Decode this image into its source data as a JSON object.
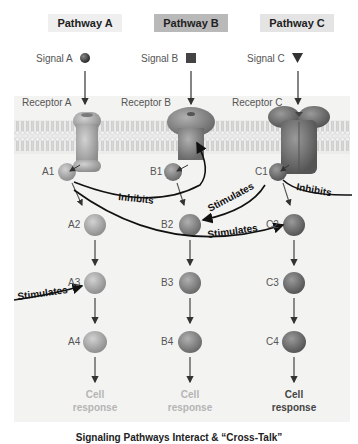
{
  "pathways": [
    {
      "header": "Pathway A",
      "signal": "Signal A",
      "signal_icon": "sphere-icon",
      "receptor": "Receptor A",
      "steps": [
        "A1",
        "A2",
        "A3",
        "A4"
      ],
      "response": "Cell\nresponse",
      "response_line1": "Cell",
      "response_line2": "response",
      "response_color": "#b5b5b5"
    },
    {
      "header": "Pathway B",
      "signal": "Signal B",
      "signal_icon": "square-icon",
      "receptor": "Receptor B",
      "steps": [
        "B1",
        "B2",
        "B3",
        "B4"
      ],
      "response_line1": "Cell",
      "response_line2": "response",
      "response_color": "#b5b5b5"
    },
    {
      "header": "Pathway C",
      "signal": "Signal C",
      "signal_icon": "triangle-down-icon",
      "receptor": "Receptor C",
      "steps": [
        "C1",
        "C2",
        "C3",
        "C4"
      ],
      "response_line1": "Cell",
      "response_line2": "response",
      "response_color": "#444444"
    }
  ],
  "interactions": [
    {
      "from": "A1",
      "to": "Receptor B",
      "label": "Inhibits"
    },
    {
      "from": "A1",
      "to": "C2",
      "label": "Stimulates"
    },
    {
      "from": "C1",
      "to": "B2",
      "label": "Stimulates"
    },
    {
      "from": "C1",
      "to": "off-right",
      "label": "Inhibits"
    },
    {
      "from": "off-left",
      "to": "A3",
      "label": "Stimulates"
    }
  ],
  "caption": "Signaling Pathways Interact & “Cross-Talk”",
  "colors": {
    "membrane": "#d8d8d6",
    "protein_light": "#a8a8a8",
    "protein_dark": "#6e6e6e",
    "arrow": "#333333",
    "panel_bg": "#f3f3f1"
  }
}
